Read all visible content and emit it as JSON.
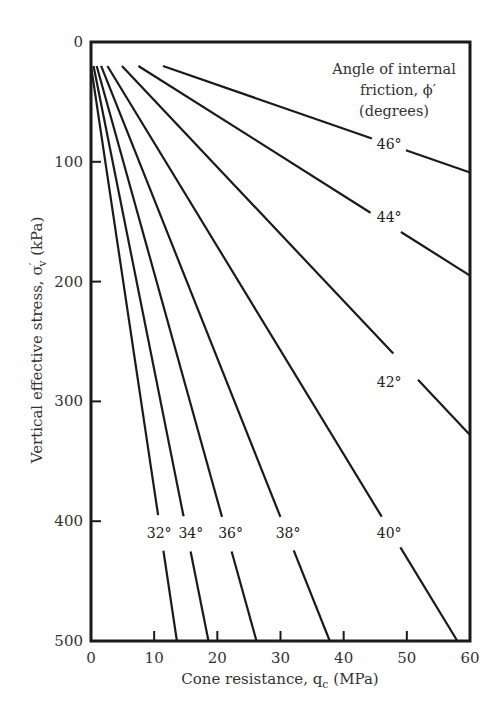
{
  "chart_data": {
    "type": "line",
    "title": "",
    "xlabel": "Cone resistance, q_c (MPa)",
    "ylabel": "Vertical effective stress, σ′_v (kPa)",
    "xlim": [
      0,
      60
    ],
    "ylim": [
      0,
      500
    ],
    "y_inverted": true,
    "x_ticks": [
      0,
      10,
      20,
      30,
      40,
      50,
      60
    ],
    "y_ticks": [
      0,
      100,
      200,
      300,
      400,
      500
    ],
    "grid": false,
    "legend_title": [
      "Angle of internal",
      "friction, ϕ′",
      "(degrees)"
    ],
    "series": [
      {
        "name": "32°",
        "label": "32°",
        "points": [
          [
            0,
            20
          ],
          [
            13.6,
            500
          ]
        ],
        "label_pos": [
          10.8,
          410
        ]
      },
      {
        "name": "34°",
        "label": "34°",
        "points": [
          [
            0.4,
            20
          ],
          [
            18.6,
            500
          ]
        ],
        "label_pos": [
          15.8,
          410
        ]
      },
      {
        "name": "36°",
        "label": "36°",
        "points": [
          [
            0.9,
            20
          ],
          [
            26.2,
            500
          ]
        ],
        "label_pos": [
          22.1,
          410
        ]
      },
      {
        "name": "38°",
        "label": "38°",
        "points": [
          [
            1.6,
            20
          ],
          [
            37.8,
            500
          ]
        ],
        "label_pos": [
          31.2,
          410
        ]
      },
      {
        "name": "40°",
        "label": "40°",
        "points": [
          [
            2.6,
            20
          ],
          [
            58.0,
            500
          ]
        ],
        "label_pos": [
          47.2,
          410
        ]
      },
      {
        "name": "42°",
        "label": "42°",
        "points": [
          [
            4.9,
            20
          ],
          [
            60,
            328
          ]
        ],
        "label_pos": [
          47.2,
          284
        ]
      },
      {
        "name": "44°",
        "label": "44°",
        "points": [
          [
            7.5,
            20
          ],
          [
            60,
            195
          ]
        ],
        "label_pos": [
          47.2,
          146
        ]
      },
      {
        "name": "46°",
        "label": "46°",
        "points": [
          [
            11.4,
            20
          ],
          [
            60,
            109
          ]
        ],
        "label_pos": [
          47.2,
          85
        ]
      }
    ]
  },
  "axes": {
    "x_title_main": "Cone resistance, q",
    "x_title_sub": "c",
    "x_title_unit": " (MPa)",
    "y_title_main": "Vertical effective stress, σ",
    "y_title_sup": "′",
    "y_title_sub": "v",
    "y_title_unit": " (kPa)",
    "x_tick_labels": [
      "0",
      "10",
      "20",
      "30",
      "40",
      "50",
      "60"
    ],
    "y_tick_labels": [
      "0",
      "100",
      "200",
      "300",
      "400",
      "500"
    ]
  },
  "legend": {
    "line1": "Angle of internal",
    "line2": "friction, ϕ′",
    "line3": "(degrees)"
  },
  "colors": {
    "line": "#1a1a1a",
    "frame": "#1a1a1a",
    "text": "#333333"
  }
}
